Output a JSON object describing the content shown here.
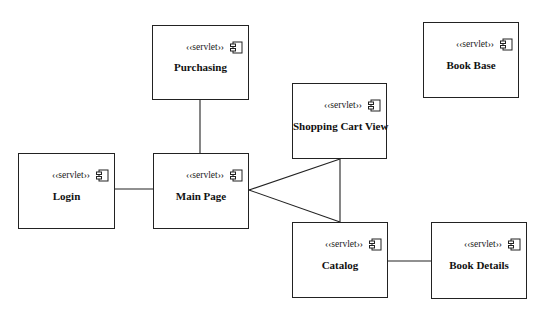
{
  "diagram": {
    "type": "uml-component-diagram",
    "stereotype_label": "««servlet»»",
    "icon": "component-icon",
    "nodes": [
      {
        "id": "purchasing",
        "label": "Purchasing",
        "stereotype": "‹‹servlet››",
        "x": 152,
        "y": 25,
        "w": 97,
        "h": 75
      },
      {
        "id": "book_base",
        "label": "Book Base",
        "stereotype": "‹‹servlet››",
        "x": 423,
        "y": 22,
        "w": 96,
        "h": 76
      },
      {
        "id": "shopping_cart_view",
        "label": "Shopping Cart View",
        "stereotype": "‹‹servlet››",
        "x": 292,
        "y": 83,
        "w": 95,
        "h": 76
      },
      {
        "id": "login",
        "label": "Login",
        "stereotype": "‹‹servlet››",
        "x": 18,
        "y": 153,
        "w": 97,
        "h": 76
      },
      {
        "id": "main_page",
        "label": "Main Page",
        "stereotype": "‹‹servlet››",
        "x": 153,
        "y": 153,
        "w": 96,
        "h": 76
      },
      {
        "id": "catalog",
        "label": "Catalog",
        "stereotype": "‹‹servlet››",
        "x": 292,
        "y": 222,
        "w": 96,
        "h": 76
      },
      {
        "id": "book_details",
        "label": "Book Details",
        "stereotype": "‹‹servlet››",
        "x": 431,
        "y": 222,
        "w": 96,
        "h": 77
      }
    ],
    "edges": [
      {
        "from": "purchasing",
        "to": "main_page",
        "points": [
          [
            200,
            100
          ],
          [
            200,
            153
          ]
        ]
      },
      {
        "from": "login",
        "to": "main_page",
        "points": [
          [
            115,
            189
          ],
          [
            153,
            189
          ]
        ]
      },
      {
        "from": "main_page",
        "to": "shopping_cart_view",
        "points": [
          [
            249,
            190
          ],
          [
            340,
            159
          ]
        ]
      },
      {
        "from": "main_page",
        "to": "catalog",
        "points": [
          [
            249,
            190
          ],
          [
            340,
            222
          ]
        ]
      },
      {
        "from": "shopping_cart_view",
        "to": "catalog",
        "points": [
          [
            340,
            159
          ],
          [
            340,
            222
          ]
        ]
      },
      {
        "from": "catalog",
        "to": "book_details",
        "points": [
          [
            388,
            261
          ],
          [
            431,
            261
          ]
        ]
      }
    ],
    "colors": {
      "stroke": "#222222",
      "background": "#ffffff",
      "text": "#111111"
    }
  }
}
